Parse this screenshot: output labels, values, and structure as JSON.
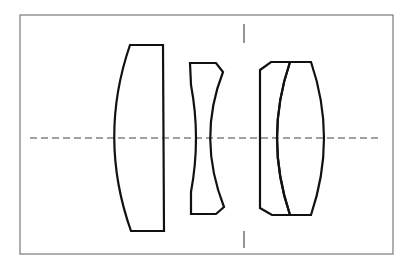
{
  "diagram": {
    "type": "optical-lens-layout",
    "colors": {
      "background": "#ffffff",
      "frame": "#7a7a7a",
      "lens_outline": "#111111",
      "optical_axis": "#444444",
      "aperture_stop": "#666666"
    },
    "frame": {
      "x": 20,
      "y": 15,
      "width": 373,
      "height": 239
    },
    "optical_axis": {
      "y": 138,
      "x_start": 30,
      "x_end": 378,
      "style": "dashed"
    },
    "aperture_stop": {
      "x": 244,
      "top": [
        24,
        43
      ],
      "bottom": [
        231,
        248
      ]
    },
    "elements": [
      {
        "id": "element-1",
        "shape": "plano-convex",
        "group": 1
      },
      {
        "id": "element-2",
        "shape": "biconcave",
        "group": 2
      },
      {
        "id": "element-3",
        "shape": "concave-plano (cemented)",
        "group": 3
      },
      {
        "id": "element-4",
        "shape": "biconvex (cemented)",
        "group": 3
      }
    ]
  }
}
